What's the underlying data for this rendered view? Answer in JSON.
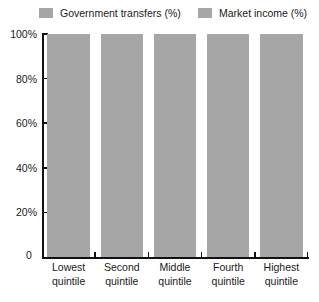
{
  "legend": {
    "position": "top",
    "entries": [
      {
        "label": "Government transfers (%)",
        "color": "#a6a6a6"
      },
      {
        "label": "Market income (%)",
        "color": "#a6a6a6"
      }
    ]
  },
  "axes": {
    "y_ticks": [
      "0",
      "20%",
      "40%",
      "60%",
      "80%",
      "100%"
    ],
    "zero_label": "0"
  },
  "chart_data": {
    "type": "bar",
    "stacked": true,
    "title": "",
    "xlabel": "",
    "ylabel": "",
    "ylim": [
      0,
      100
    ],
    "ytick_values": [
      0,
      20,
      40,
      60,
      80,
      100
    ],
    "ytick_labels": [
      "0",
      "20%",
      "40%",
      "60%",
      "80%",
      "100%"
    ],
    "grid": false,
    "legend_position": "top",
    "categories": [
      "Lowest quintile",
      "Second quintile",
      "Middle quintile",
      "Fourth quintile",
      "Highest quintile"
    ],
    "category_lines": [
      [
        "Lowest",
        "quintile"
      ],
      [
        "Second",
        "quintile"
      ],
      [
        "Middle",
        "quintile"
      ],
      [
        "Fourth",
        "quintile"
      ],
      [
        "Highest",
        "quintile"
      ]
    ],
    "series": [
      {
        "name": "Government transfers (%)",
        "color": "#a6a6a6",
        "values": [
          100,
          100,
          100,
          100,
          100
        ]
      },
      {
        "name": "Market income (%)",
        "color": "#a6a6a6",
        "values": [
          0,
          0,
          0,
          0,
          0
        ]
      }
    ],
    "totals": [
      100,
      100,
      100,
      100,
      100
    ]
  }
}
